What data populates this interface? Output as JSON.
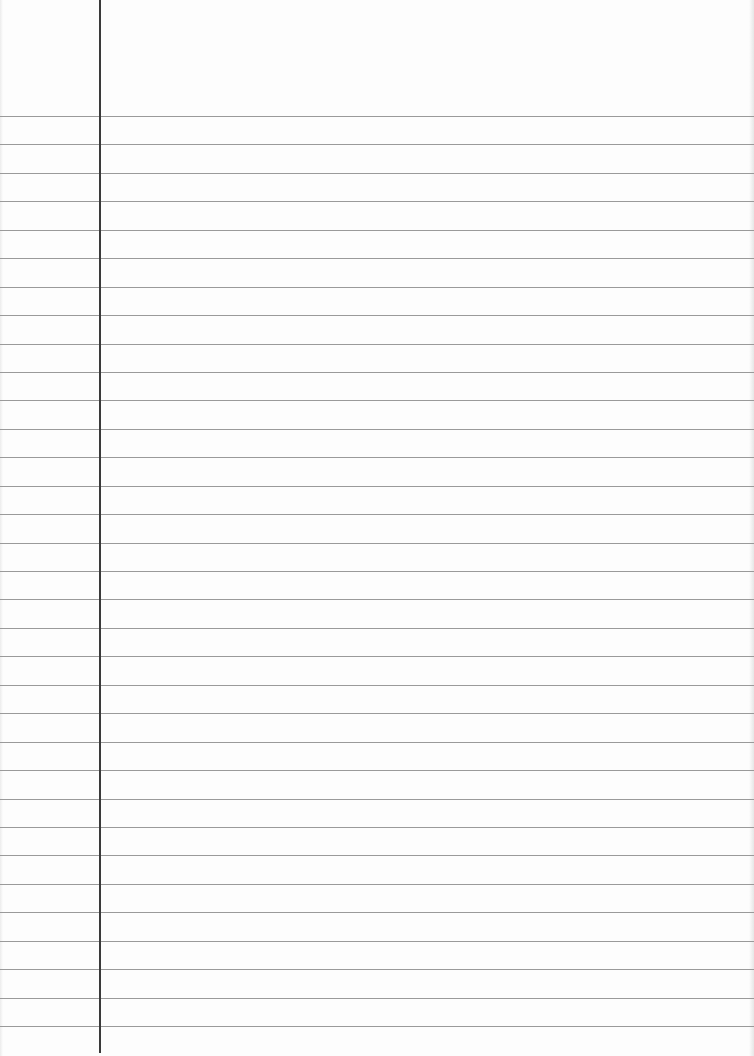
{
  "page": {
    "type": "lined-paper",
    "width": 754,
    "height": 1056,
    "background_color": "#fdfdfd",
    "rule_color": "#9a9a9a",
    "margin_color": "#3a3a3a",
    "margin_x": 99,
    "first_rule_y": 116,
    "rule_spacing": 28.44,
    "rule_count": 33,
    "text": ""
  }
}
